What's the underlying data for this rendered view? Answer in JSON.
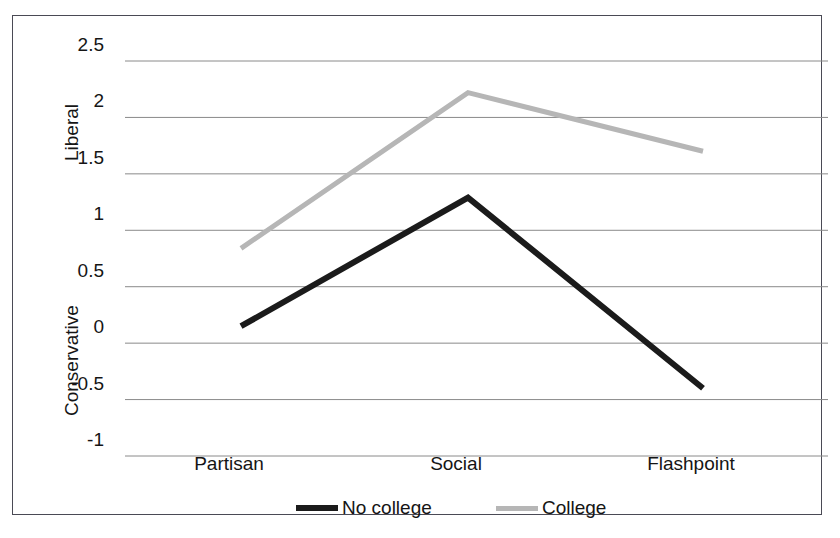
{
  "chart_data": {
    "type": "line",
    "title": "",
    "xlabel": "",
    "ylabel": "",
    "categories": [
      "Partisan",
      "Social",
      "Flashpoint"
    ],
    "series": [
      {
        "name": "No college",
        "values": [
          0.15,
          1.29,
          -0.4
        ],
        "color": "#1b1b1b"
      },
      {
        "name": "College",
        "values": [
          0.84,
          2.22,
          1.7
        ],
        "color": "#b6b6b6"
      }
    ],
    "ylim": [
      -1,
      2.5
    ],
    "ytick_labels": [
      "2.5",
      "2",
      "1.5",
      "1",
      "0.5",
      "0",
      "-0.5",
      "-1"
    ],
    "ytick_values": [
      2.5,
      2,
      1.5,
      1,
      0.5,
      0,
      -0.5,
      -1
    ],
    "axis_side_labels": [
      {
        "text": "Liberal",
        "position": "upper"
      },
      {
        "text": "Conservative",
        "position": "lower"
      }
    ],
    "grid": true,
    "grid_color": "#8a8a8a",
    "legend_position": "bottom",
    "border_color": "#4a4a55",
    "background": "#ffffff"
  },
  "legend": {
    "items": [
      {
        "label": "No college",
        "swatch": "black"
      },
      {
        "label": "College",
        "swatch": "gray"
      }
    ]
  }
}
